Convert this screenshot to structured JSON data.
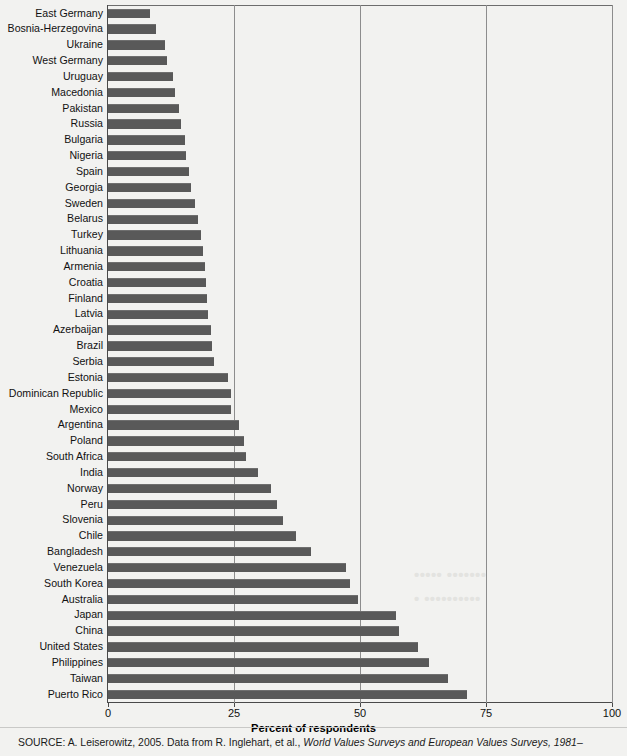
{
  "chart_data": {
    "type": "bar",
    "orientation": "horizontal",
    "title": "",
    "xlabel": "Percent of respondents",
    "ylabel": "",
    "xlim": [
      0,
      100
    ],
    "xticks": [
      0,
      25,
      50,
      75,
      100
    ],
    "xtick_labels": [
      "0",
      "25",
      "50",
      "75",
      "100"
    ],
    "grid": "vertical",
    "legend": "none",
    "bar_color": "#595959",
    "background_color": "#f2f2f0",
    "categories": [
      "East Germany",
      "Bosnia-Herzegovina",
      "Ukraine",
      "West Germany",
      "Uruguay",
      "Macedonia",
      "Pakistan",
      "Russia",
      "Bulgaria",
      "Nigeria",
      "Spain",
      "Georgia",
      "Sweden",
      "Belarus",
      "Turkey",
      "Lithuania",
      "Armenia",
      "Croatia",
      "Finland",
      "Latvia",
      "Azerbaijan",
      "Brazil",
      "Serbia",
      "Estonia",
      "Dominican Republic",
      "Mexico",
      "Argentina",
      "Poland",
      "South Africa",
      "India",
      "Norway",
      "Peru",
      "Slovenia",
      "Chile",
      "Bangladesh",
      "Venezuela",
      "South Korea",
      "Australia",
      "Japan",
      "China",
      "United States",
      "Philippines",
      "Taiwan",
      "Puerto Rico"
    ],
    "values": [
      8.3,
      9.6,
      11.3,
      11.8,
      12.9,
      13.3,
      14.1,
      14.4,
      15.2,
      15.4,
      16.1,
      16.4,
      17.3,
      17.8,
      18.5,
      18.8,
      19.3,
      19.5,
      19.7,
      19.9,
      20.4,
      20.6,
      21.0,
      23.9,
      24.4,
      24.5,
      25.9,
      27.0,
      27.4,
      29.8,
      32.3,
      33.5,
      34.8,
      37.3,
      40.3,
      47.2,
      48.1,
      49.7,
      57.2,
      57.7,
      61.5,
      63.6,
      67.4,
      71.2
    ]
  },
  "xaxis": {
    "label": "Percent of respondents"
  },
  "source": {
    "prefix": "SOURCE: A. Leiserowitz, 2005. Data from R. Inglehart, et al., ",
    "italic": "World Values Surveys and European Values Surveys, 1981–"
  },
  "bleed_through": {
    "line1": "••••• •••••••",
    "line2": "• ••••••••••"
  }
}
